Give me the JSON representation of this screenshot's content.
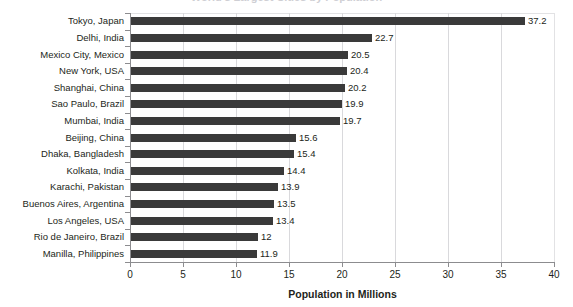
{
  "title_sliver": "World's Largest Cities by Population",
  "chart_data": {
    "type": "bar",
    "orientation": "horizontal",
    "title": "",
    "xlabel": "Population in Millions",
    "ylabel": "",
    "xlim": [
      0,
      40
    ],
    "xticks": [
      0,
      5,
      10,
      15,
      20,
      25,
      30,
      35,
      40
    ],
    "xtick_labels": [
      "0",
      "5",
      "10",
      "15",
      "20",
      "25",
      "30",
      "35",
      "40"
    ],
    "grid": "vertical",
    "legend": "none",
    "bar_color": "#3a3a3a",
    "categories": [
      "Tokyo, Japan",
      "Delhi, India",
      "Mexico City, Mexico",
      "New York, USA",
      "Shanghai, China",
      "Sao Paulo, Brazil",
      "Mumbai, India",
      "Beijing, China",
      "Dhaka, Bangladesh",
      "Kolkata, India",
      "Karachi, Pakistan",
      "Buenos Aires, Argentina",
      "Los Angeles, USA",
      "Rio de Janeiro, Brazil",
      "Manilla, Philippines"
    ],
    "values": [
      37.2,
      22.7,
      20.5,
      20.4,
      20.2,
      19.9,
      19.7,
      15.6,
      15.4,
      14.4,
      13.9,
      13.5,
      13.4,
      12,
      11.9
    ],
    "value_labels": [
      "37.2",
      "22.7",
      "20.5",
      "20.4",
      "20.2",
      "19.9",
      "19.7",
      "15.6",
      "15.4",
      "14.4",
      "13.9",
      "13.5",
      "13.4",
      "12",
      "11.9"
    ]
  }
}
